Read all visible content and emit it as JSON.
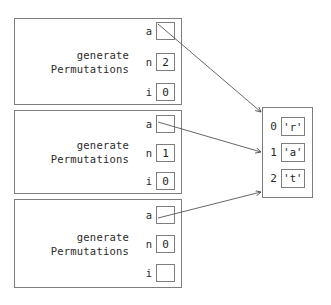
{
  "diagram": {
    "stroke_color": "#7d7d7d",
    "text_color": "#2b2b2b",
    "background": "#ffffff"
  },
  "frames": [
    {
      "name": "frame-1",
      "label": "generate\nPermutations",
      "vars": [
        {
          "name": "a",
          "value": "",
          "is_pointer": true
        },
        {
          "name": "n",
          "value": "2",
          "is_pointer": false
        },
        {
          "name": "i",
          "value": "0",
          "is_pointer": false
        }
      ]
    },
    {
      "name": "frame-2",
      "label": "generate\nPermutations",
      "vars": [
        {
          "name": "a",
          "value": "",
          "is_pointer": true
        },
        {
          "name": "n",
          "value": "1",
          "is_pointer": false
        },
        {
          "name": "i",
          "value": "0",
          "is_pointer": false
        }
      ]
    },
    {
      "name": "frame-3",
      "label": "generate\nPermutations",
      "vars": [
        {
          "name": "a",
          "value": "",
          "is_pointer": true
        },
        {
          "name": "n",
          "value": "0",
          "is_pointer": false
        },
        {
          "name": "i",
          "value": "",
          "is_pointer": false
        }
      ]
    }
  ],
  "array": {
    "name": "char-array",
    "cells": [
      {
        "index": "0",
        "value": "'r'"
      },
      {
        "index": "1",
        "value": "'a'"
      },
      {
        "index": "2",
        "value": "'t'"
      }
    ]
  },
  "pointers": [
    {
      "name": "pointer-frame-1-to-array",
      "from_frame": "frame-1",
      "from_var": "a"
    },
    {
      "name": "pointer-frame-2-to-array",
      "from_frame": "frame-2",
      "from_var": "a"
    },
    {
      "name": "pointer-frame-3-to-array",
      "from_frame": "frame-3",
      "from_var": "a"
    }
  ]
}
